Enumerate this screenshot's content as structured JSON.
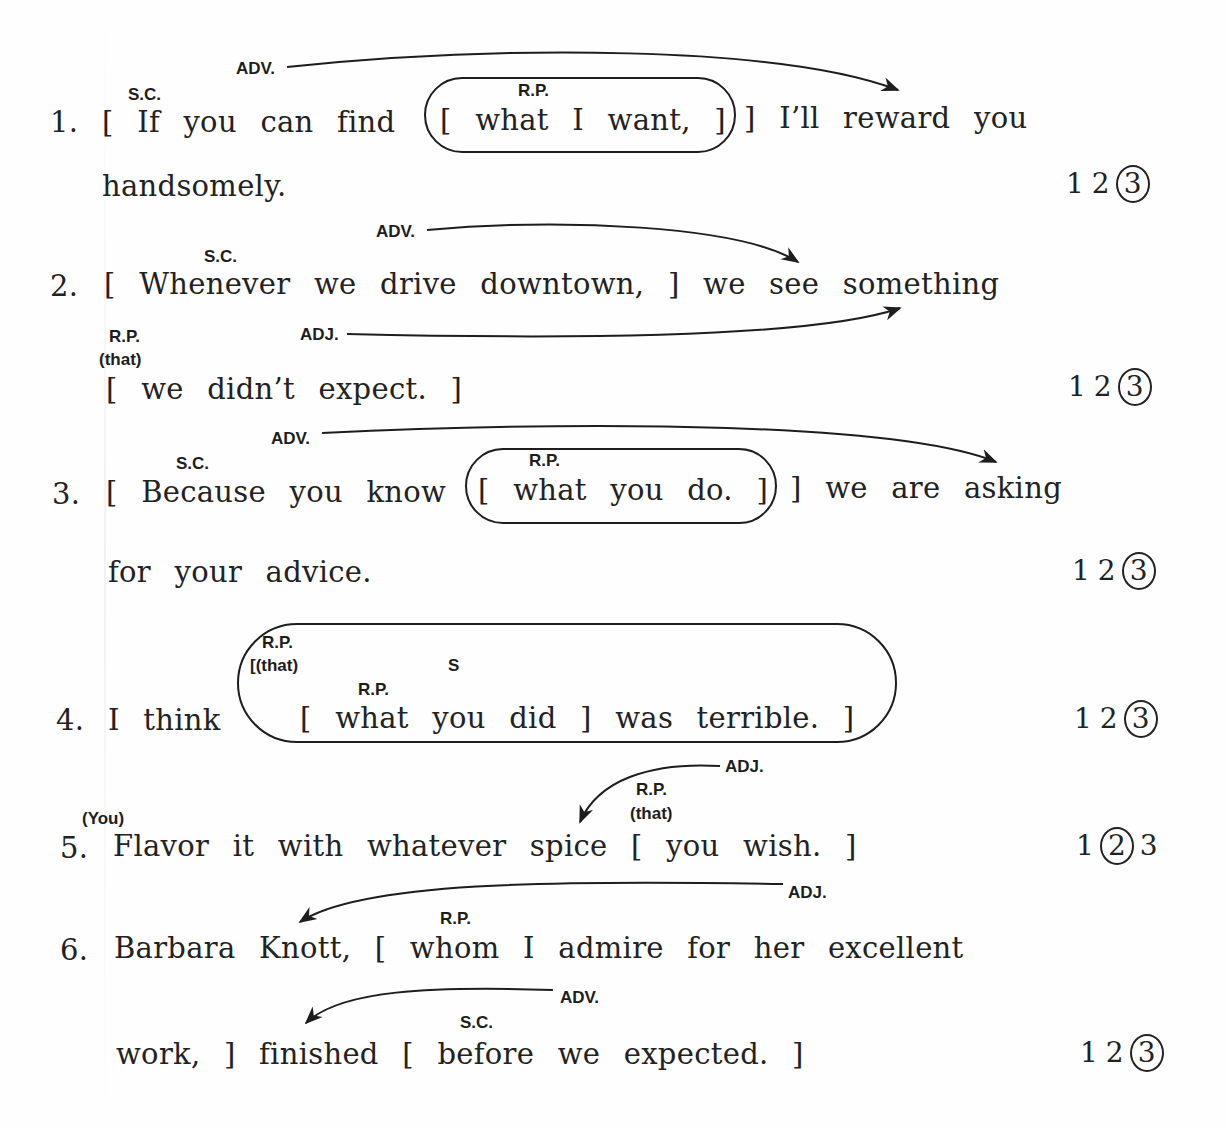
{
  "items": [
    {
      "number": "1.",
      "line1": "[ If you can find",
      "boxed": "[ what I want, ]",
      "line1_rest": "] I’ll reward you",
      "line2": "handsomely.",
      "labels": {
        "sc": "S.C.",
        "adv": "ADV.",
        "rp": "R.P."
      },
      "choices": [
        "1",
        "2",
        "3"
      ],
      "selected": "3"
    },
    {
      "number": "2.",
      "line1": "[ Whenever we drive downtown, ] we see something",
      "line2": "[ we didn’t expect. ]",
      "labels": {
        "sc": "S.C.",
        "adv": "ADV.",
        "rp": "R.P.",
        "rp_implied": "(that)",
        "adj": "ADJ."
      },
      "choices": [
        "1",
        "2",
        "3"
      ],
      "selected": "3"
    },
    {
      "number": "3.",
      "line1": "[ Because you know",
      "boxed": "[ what you do. ]",
      "line1_rest": "] we are asking",
      "line2": "for your advice.",
      "labels": {
        "sc": "S.C.",
        "adv": "ADV.",
        "rp": "R.P."
      },
      "choices": [
        "1",
        "2",
        "3"
      ],
      "selected": "3"
    },
    {
      "number": "4.",
      "line1": "I think",
      "boxed": "[ what you did ] was terrible. ]",
      "labels": {
        "rp_outer": "R.P.",
        "rp_outer_implied": "[(that)",
        "s": "S",
        "rp_inner": "R.P."
      },
      "choices": [
        "1",
        "2",
        "3"
      ],
      "selected": "3"
    },
    {
      "number": "5.",
      "line1": "Flavor it with whatever spice [ you wish. ]",
      "labels": {
        "subject_implied": "(You)",
        "adj": "ADJ.",
        "rp": "R.P.",
        "rp_implied": "(that)"
      },
      "choices": [
        "1",
        "2",
        "3"
      ],
      "selected": "2"
    },
    {
      "number": "6.",
      "line1": "Barbara Knott, [ whom I admire for her excellent",
      "line2": "work, ] finished [ before we expected. ]",
      "labels": {
        "adj": "ADJ.",
        "rp": "R.P.",
        "adv": "ADV.",
        "sc": "S.C."
      },
      "choices": [
        "1",
        "2",
        "3"
      ],
      "selected": "3"
    }
  ]
}
